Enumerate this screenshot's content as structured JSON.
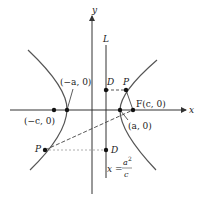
{
  "diagram": {
    "axes": {
      "x_label": "x",
      "y_label": "y"
    },
    "directrix": {
      "label": "L",
      "equation_lhs": "x =",
      "equation_num": "a",
      "equation_exp": "2",
      "equation_den": "c"
    },
    "points": {
      "neg_c": "(−c, 0)",
      "neg_a": "(−a, 0)",
      "pos_a": "(a, 0)",
      "focus": "F(c, 0)",
      "p_upper": "P",
      "d_upper": "D",
      "p_lower": "P",
      "d_lower": "D"
    },
    "colors": {
      "curve": "#555555",
      "axis": "#333333",
      "dash": "#444444",
      "point": "#111111"
    }
  }
}
